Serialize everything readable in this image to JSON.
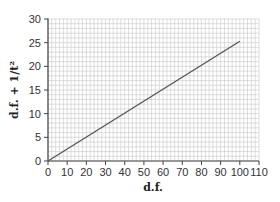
{
  "chart_data": {
    "type": "line",
    "title": "",
    "xlabel": "d.f.",
    "ylabel": "d.f. + 1/t²",
    "xlim": [
      0,
      110
    ],
    "ylim": [
      0,
      30
    ],
    "x_ticks": [
      0,
      10,
      20,
      30,
      40,
      50,
      60,
      70,
      80,
      90,
      100,
      110
    ],
    "y_ticks": [
      0,
      5,
      10,
      15,
      20,
      25,
      30
    ],
    "grid": true,
    "grid_minor_step_x": 2,
    "grid_minor_step_y": 1,
    "legend": null,
    "series": [
      {
        "name": "line",
        "x": [
          0,
          100
        ],
        "values": [
          0,
          25.3
        ],
        "color": "#555555"
      }
    ]
  },
  "colors": {
    "grid": "#c8c8c8",
    "axis": "#444444",
    "line": "#555555"
  }
}
